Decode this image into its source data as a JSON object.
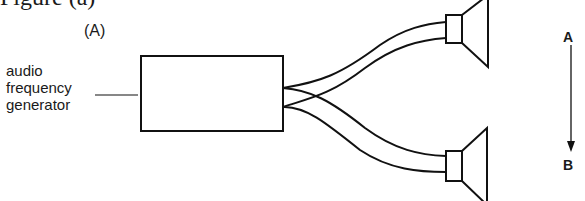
{
  "figure": {
    "caption_partial": "Figure (a)",
    "panel_label": "(A)"
  },
  "generator": {
    "label_lines": [
      "audio",
      "frequency",
      "generator"
    ]
  },
  "direction": {
    "start_label": "A",
    "end_label": "B"
  },
  "speakers": [
    {
      "name": "top-speaker"
    },
    {
      "name": "bottom-speaker"
    }
  ]
}
